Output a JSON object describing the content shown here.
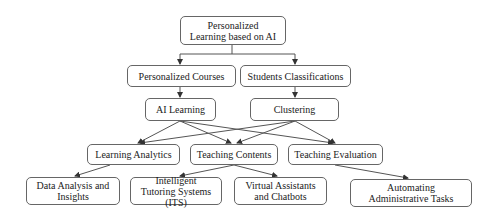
{
  "diagram": {
    "type": "hierarchy-flow",
    "nodes": {
      "root": "Personalized Learning based on AI",
      "personalized_courses": "Personalized Courses",
      "students_classifications": "Students Classifications",
      "ai_learning": "AI Learning",
      "clustering": "Clustering",
      "learning_analytics": "Learning Analytics",
      "teaching_contents": "Teaching Contents",
      "teaching_evaluation": "Teaching Evaluation",
      "data_analysis": "Data Analysis and Insights",
      "its": "Intelligent Tutoring Systems (ITS)",
      "virtual_assistants": "Virtual Assistants and Chatbots",
      "automating_tasks": "Automating Administrative Tasks"
    },
    "edges": [
      [
        "root",
        "personalized_courses"
      ],
      [
        "root",
        "students_classifications"
      ],
      [
        "personalized_courses",
        "ai_learning"
      ],
      [
        "students_classifications",
        "clustering"
      ],
      [
        "ai_learning",
        "learning_analytics"
      ],
      [
        "ai_learning",
        "teaching_contents"
      ],
      [
        "ai_learning",
        "teaching_evaluation"
      ],
      [
        "clustering",
        "learning_analytics"
      ],
      [
        "clustering",
        "teaching_contents"
      ],
      [
        "clustering",
        "teaching_evaluation"
      ],
      [
        "learning_analytics",
        "data_analysis"
      ],
      [
        "teaching_contents",
        "its"
      ],
      [
        "teaching_contents",
        "virtual_assistants"
      ],
      [
        "teaching_evaluation",
        "automating_tasks"
      ]
    ],
    "colors": {
      "border": "#666666",
      "edge": "#555555",
      "background": "#ffffff"
    }
  }
}
